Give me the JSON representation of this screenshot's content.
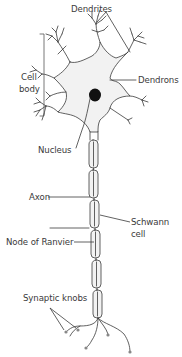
{
  "diagram": {
    "type": "labeled-illustration",
    "labels": {
      "dendrites": "Dendrites",
      "cell_body_line1": "Cell",
      "cell_body_line2": "body",
      "dendrons": "Dendrons",
      "nucleus": "Nucleus",
      "axon": "Axon",
      "schwann_cell_line1": "Schwann",
      "schwann_cell_line2": "cell",
      "node_of_ranvier": "Node of Ranvier",
      "synaptic_knobs": "Synaptic knobs"
    },
    "colors": {
      "line": "#3a3a3a",
      "cell_fill": "#f2f2f2",
      "nucleus": "#111111",
      "text": "#3a3a3a",
      "background": "#ffffff"
    }
  }
}
